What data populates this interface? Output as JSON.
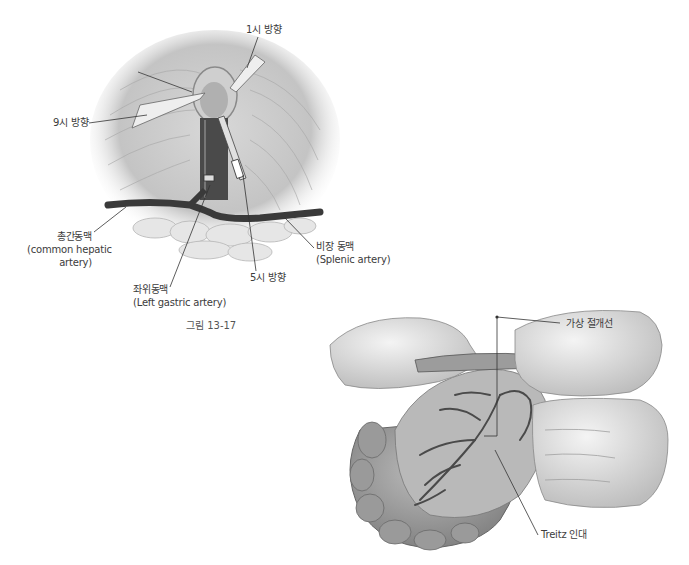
{
  "figure_top": {
    "caption": "그림 13-17",
    "labels": {
      "one_oclock": "1시 방향",
      "nine_oclock": "9시 방향",
      "five_oclock": "5시 방향",
      "common_hepatic_ko": "총간동맥",
      "common_hepatic_en1": "(common hepatic",
      "common_hepatic_en2": "artery)",
      "left_gastric_ko": "좌위동맥",
      "left_gastric_en": "(Left gastric artery)",
      "splenic_ko": "비장 동맥",
      "splenic_en": "(Splenic artery)"
    }
  },
  "figure_bottom": {
    "labels": {
      "virtual_incision": "가상 절개선",
      "treitz": "Treitz 인대"
    }
  }
}
